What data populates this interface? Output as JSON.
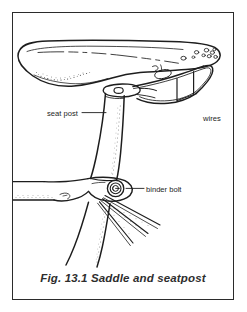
{
  "figure": {
    "caption": "Fig. 13.1 Saddle and seatpost",
    "border_color": "#2b2b2b",
    "background_color": "#ffffff",
    "ink_color": "#1d1d1d",
    "width": 247,
    "height": 312
  },
  "labels": {
    "seat_post": "seat post",
    "binder_bolt": "binder bolt",
    "wires": "wires"
  },
  "parts": [
    {
      "name": "saddle",
      "label": ""
    },
    {
      "name": "seat-post",
      "label": "seat post"
    },
    {
      "name": "binder-bolt",
      "label": "binder bolt"
    },
    {
      "name": "wires",
      "label": "wires"
    },
    {
      "name": "top-tube",
      "label": ""
    },
    {
      "name": "seat-tube",
      "label": ""
    },
    {
      "name": "seat-stays",
      "label": ""
    }
  ]
}
